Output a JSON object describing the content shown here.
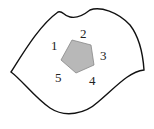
{
  "diagram": {
    "type": "region-with-pentagon",
    "outline_color": "#111111",
    "pentagon_fill": "#b8b8b8",
    "pentagon_stroke": "#888888",
    "labels": [
      {
        "id": "1",
        "text": "1",
        "x": 51,
        "y": 50
      },
      {
        "id": "2",
        "text": "2",
        "x": 80,
        "y": 38
      },
      {
        "id": "3",
        "text": "3",
        "x": 100,
        "y": 60
      },
      {
        "id": "4",
        "text": "4",
        "x": 89,
        "y": 85
      },
      {
        "id": "5",
        "text": "5",
        "x": 55,
        "y": 82
      }
    ]
  }
}
